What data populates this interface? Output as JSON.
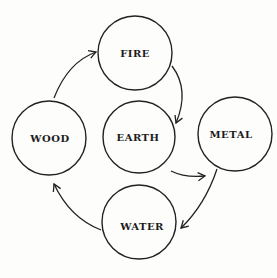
{
  "diagram": {
    "nodes": [
      {
        "id": "fire",
        "label": "FIRE",
        "cx": 135,
        "cy": 53,
        "r": 37
      },
      {
        "id": "wood",
        "label": "WOOD",
        "cx": 49,
        "cy": 138,
        "r": 37
      },
      {
        "id": "earth",
        "label": "EARTH",
        "cx": 139,
        "cy": 137,
        "r": 36
      },
      {
        "id": "metal",
        "label": "METAL",
        "cx": 235,
        "cy": 134,
        "r": 37
      },
      {
        "id": "water",
        "label": "WATER",
        "cx": 139,
        "cy": 222,
        "r": 37
      }
    ],
    "edges": [
      {
        "from": "wood",
        "to": "fire"
      },
      {
        "from": "fire",
        "to": "earth"
      },
      {
        "from": "earth",
        "to": "metal"
      },
      {
        "from": "metal",
        "to": "water"
      },
      {
        "from": "water",
        "to": "wood"
      }
    ],
    "colors": {
      "stroke": "#222222",
      "text": "#1c1c1c",
      "background": "#fdfdfc"
    }
  }
}
